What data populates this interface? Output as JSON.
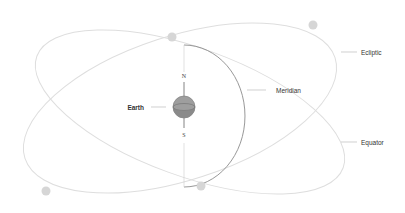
{
  "diagram": {
    "labels": {
      "earth": "Earth",
      "meridian": "Meridian",
      "ecliptic": "Ecliptic",
      "equator": "Equator",
      "north": "N",
      "south": "S"
    },
    "colors": {
      "orbit": "#dddddd",
      "meridian": "#888888",
      "dot": "#d6d6d6",
      "earth_top": "#a0a0a0",
      "earth_bottom": "#8a8a8a",
      "leader": "#bbbbbb",
      "text": "#333333"
    }
  }
}
